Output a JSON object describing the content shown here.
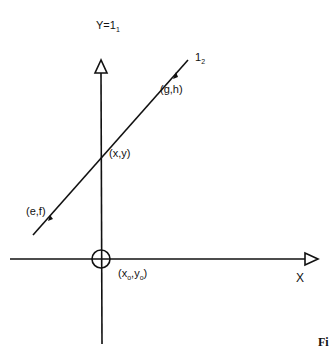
{
  "diagram": {
    "y_axis_label": {
      "main": "Y=1",
      "sub": "1"
    },
    "x_axis_label": "X",
    "line_label": {
      "main": "1",
      "sub": "2"
    },
    "points": {
      "gh": "(g,h)",
      "xy": "(x,y)",
      "ef": "(e,f)",
      "origin": {
        "open": "(x",
        "sub1": "o",
        "mid": ",y",
        "sub2": "o",
        "close": ")"
      }
    },
    "figure_caption_fragment": "Fi",
    "colors": {
      "stroke": "#111111",
      "background": "#ffffff"
    }
  }
}
